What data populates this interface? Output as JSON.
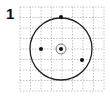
{
  "figure": {
    "number_label": "1"
  },
  "grid": {
    "x": 20,
    "y": 7,
    "size": 84,
    "divisions": 8,
    "line_color": "#9a9a9a"
  },
  "circle": {
    "cx": 61,
    "cy": 49,
    "r": 31,
    "stroke": "#222222"
  },
  "center_ring": {
    "cx": 61,
    "cy": 49,
    "r": 5,
    "stroke": "#555555"
  },
  "points": [
    {
      "name": "center-point",
      "cx": 61,
      "cy": 49
    },
    {
      "name": "top-point",
      "cx": 61,
      "cy": 17
    },
    {
      "name": "left-point",
      "cx": 41,
      "cy": 49
    },
    {
      "name": "lower-right-point",
      "cx": 82,
      "cy": 60
    }
  ],
  "point_color": "#111111"
}
